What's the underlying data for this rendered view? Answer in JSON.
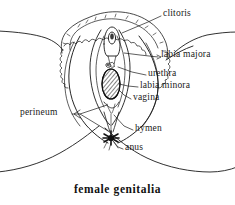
{
  "figure": {
    "caption": "female genitalia",
    "line_color": "#1a1a1a",
    "background_color": "#ffffff",
    "fill_color": "#000000"
  },
  "labels": [
    {
      "id": "clitoris",
      "text": "clitoris",
      "x": 163,
      "y": 14
    },
    {
      "id": "labia-majora",
      "text": "labia majora",
      "x": 161,
      "y": 55
    },
    {
      "id": "urethra",
      "text": "urethra",
      "x": 148,
      "y": 74
    },
    {
      "id": "labia-minora",
      "text": "labia minora",
      "x": 140,
      "y": 86
    },
    {
      "id": "vagina",
      "text": "vagina",
      "x": 133,
      "y": 98
    },
    {
      "id": "perineum",
      "text": "perineum",
      "x": 31,
      "y": 112
    },
    {
      "id": "hymen",
      "text": "hymen",
      "x": 135,
      "y": 129
    },
    {
      "id": "anus",
      "text": "anus",
      "x": 125,
      "y": 148
    }
  ],
  "parts": [
    {
      "id": "mons-pubis",
      "name": "mons pubis with pubic hair"
    },
    {
      "id": "clitoral-hood",
      "name": "clitoral hood and glans"
    },
    {
      "id": "urethral-opening",
      "name": "urethral opening"
    },
    {
      "id": "vaginal-opening",
      "name": "vaginal opening, hatched"
    },
    {
      "id": "labia-majora",
      "name": "labia majora outer folds"
    },
    {
      "id": "labia-minora",
      "name": "labia minora inner folds"
    },
    {
      "id": "perineum",
      "name": "perineum region"
    },
    {
      "id": "anus",
      "name": "anus star marking"
    },
    {
      "id": "thigh-left",
      "name": "left thigh contour"
    },
    {
      "id": "thigh-right",
      "name": "right thigh contour"
    },
    {
      "id": "buttock-left",
      "name": "left buttock contour"
    },
    {
      "id": "buttock-right",
      "name": "right buttock contour"
    }
  ]
}
